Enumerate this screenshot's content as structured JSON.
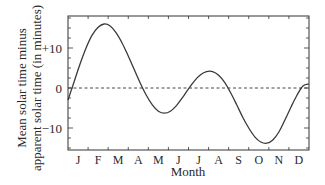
{
  "chart_data": {
    "type": "line",
    "title": "",
    "xlabel": "Month",
    "ylabel_lines": [
      "Mean solar time minus",
      "apparent solar time (in minutes)"
    ],
    "x_tick_labels": [
      "J",
      "F",
      "M",
      "A",
      "M",
      "J",
      "J",
      "A",
      "S",
      "O",
      "N",
      "D"
    ],
    "y_ticks": [
      {
        "value": 10,
        "label": "+10"
      },
      {
        "value": 0,
        "label": "0"
      },
      {
        "value": -10,
        "label": "−10"
      }
    ],
    "xlim": [
      0,
      12
    ],
    "ylim": [
      -15.5,
      18
    ],
    "reference_line": {
      "value": 0,
      "style": "dashed"
    },
    "series": [
      {
        "name": "Equation of time",
        "x_unit": "months since Jan 1",
        "points": [
          [
            0.0,
            -3.0
          ],
          [
            0.25,
            1.5
          ],
          [
            0.5,
            6.0
          ],
          [
            0.75,
            10.0
          ],
          [
            1.0,
            13.2
          ],
          [
            1.25,
            15.2
          ],
          [
            1.5,
            16.0
          ],
          [
            1.75,
            15.5
          ],
          [
            2.0,
            13.8
          ],
          [
            2.25,
            11.2
          ],
          [
            2.5,
            8.0
          ],
          [
            2.75,
            4.6
          ],
          [
            3.0,
            1.2
          ],
          [
            3.25,
            -1.8
          ],
          [
            3.5,
            -4.2
          ],
          [
            3.75,
            -5.8
          ],
          [
            4.0,
            -6.3
          ],
          [
            4.25,
            -5.8
          ],
          [
            4.5,
            -4.4
          ],
          [
            4.75,
            -2.4
          ],
          [
            5.0,
            -0.2
          ],
          [
            5.25,
            1.8
          ],
          [
            5.5,
            3.3
          ],
          [
            5.75,
            4.1
          ],
          [
            6.0,
            4.1
          ],
          [
            6.25,
            3.2
          ],
          [
            6.5,
            1.4
          ],
          [
            6.75,
            -1.2
          ],
          [
            7.0,
            -4.2
          ],
          [
            7.25,
            -7.3
          ],
          [
            7.5,
            -10.0
          ],
          [
            7.75,
            -12.2
          ],
          [
            8.0,
            -13.5
          ],
          [
            8.25,
            -13.8
          ],
          [
            8.5,
            -13.0
          ],
          [
            8.75,
            -11.0
          ],
          [
            9.0,
            -8.0
          ],
          [
            9.25,
            -4.8
          ],
          [
            9.5,
            -1.8
          ],
          [
            9.75,
            0.5
          ],
          [
            10.0,
            1.0
          ]
        ]
      }
    ]
  }
}
